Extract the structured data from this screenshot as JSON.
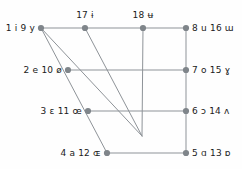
{
  "figure": {
    "type": "vowel-quadrilateral-diagram",
    "width": 242,
    "height": 169,
    "background_color": "#fefefe",
    "line_color": "#8e9398",
    "node_color": "#7f858a",
    "text_color": "#1a1a1a",
    "node_radius": 3.1,
    "line_width": 1.0
  },
  "chart_data": {
    "type": "scatter",
    "title": "",
    "xlabel": "",
    "ylabel": "",
    "grid": false,
    "legend": "none",
    "xlim": [
      0,
      242
    ],
    "ylim": [
      0,
      169
    ],
    "nodes": [
      {
        "id": "n1",
        "label": "1 i 9 y",
        "numbers": [
          1,
          9
        ],
        "symbols": [
          "i",
          "y"
        ],
        "x": 41,
        "y": 28,
        "label_pos": "left"
      },
      {
        "id": "n17",
        "label": "17 ɨ",
        "numbers": [
          17
        ],
        "symbols": [
          "ɨ"
        ],
        "x": 85,
        "y": 28,
        "label_pos": "top"
      },
      {
        "id": "n18",
        "label": "18 ʉ",
        "numbers": [
          18
        ],
        "symbols": [
          "ʉ"
        ],
        "x": 143,
        "y": 28,
        "label_pos": "top"
      },
      {
        "id": "n8",
        "label": "8 u 16 ɯ",
        "numbers": [
          8,
          16
        ],
        "symbols": [
          "u",
          "ɯ"
        ],
        "x": 186,
        "y": 28,
        "label_pos": "right"
      },
      {
        "id": "n2",
        "label": "2 e 10 ø",
        "numbers": [
          2,
          10
        ],
        "symbols": [
          "e",
          "ø"
        ],
        "x": 68,
        "y": 70,
        "label_pos": "left"
      },
      {
        "id": "n7",
        "label": "7 o 15 ɣ",
        "numbers": [
          7,
          15
        ],
        "symbols": [
          "o",
          "ɣ"
        ],
        "x": 186,
        "y": 70,
        "label_pos": "right"
      },
      {
        "id": "n3",
        "label": "3 ɛ 11 œ",
        "numbers": [
          3,
          11
        ],
        "symbols": [
          "ɛ",
          "œ"
        ],
        "x": 88,
        "y": 111,
        "label_pos": "left"
      },
      {
        "id": "n6",
        "label": "6 ɔ 14 ʌ",
        "numbers": [
          6,
          14
        ],
        "symbols": [
          "ɔ",
          "ʌ"
        ],
        "x": 186,
        "y": 111,
        "label_pos": "right"
      },
      {
        "id": "n4",
        "label": "4 a 12 ɶ",
        "numbers": [
          4,
          12
        ],
        "symbols": [
          "a",
          "ɶ"
        ],
        "x": 107,
        "y": 153,
        "label_pos": "left"
      },
      {
        "id": "n5",
        "label": "5 ɑ 13 ɒ",
        "numbers": [
          5,
          13
        ],
        "symbols": [
          "ɑ",
          "ɒ"
        ],
        "x": 186,
        "y": 153,
        "label_pos": "right"
      }
    ],
    "convergence_point": {
      "x": 142,
      "y": 136
    },
    "edges": [
      {
        "from": "n1",
        "to": "n8",
        "kind": "horizontal-top"
      },
      {
        "from": "n2",
        "to": "n7",
        "kind": "horizontal-mid-high"
      },
      {
        "from": "n3",
        "to": "n6",
        "kind": "horizontal-mid-low"
      },
      {
        "from": "n4",
        "to": "n5",
        "kind": "horizontal-bottom"
      },
      {
        "from": "n8",
        "to": "n5",
        "kind": "vertical-right"
      },
      {
        "from": "n1",
        "to": "n4",
        "kind": "diagonal-left-edge"
      },
      {
        "from": "n17",
        "to": "converge",
        "kind": "diagonal-converging"
      },
      {
        "from": "n18",
        "to": "converge",
        "kind": "vertical-converging"
      },
      {
        "from": "n1",
        "to": "converge",
        "kind": "diagonal-converging-hidden"
      }
    ]
  }
}
